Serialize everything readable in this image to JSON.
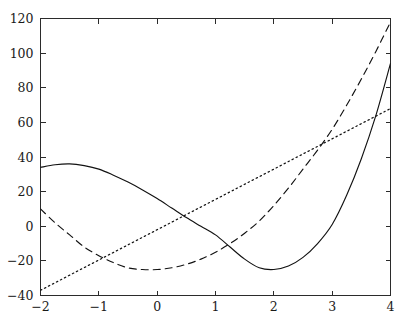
{
  "chart_data": {
    "type": "line",
    "title": "",
    "subtitle": "",
    "xlabel": "",
    "ylabel": "",
    "xlim": [
      -2,
      4
    ],
    "ylim": [
      -40,
      120
    ],
    "grid": false,
    "legend_position": "none",
    "x_ticks": [
      -2,
      -1,
      0,
      1,
      2,
      3,
      4
    ],
    "x_tick_labels": [
      "-2",
      "-1",
      "0",
      "1",
      "2",
      "3",
      "4"
    ],
    "y_ticks": [
      -40,
      -20,
      0,
      20,
      40,
      60,
      80,
      100,
      120
    ],
    "y_tick_labels": [
      "-40",
      "-20",
      "0",
      "20",
      "40",
      "60",
      "80",
      "100",
      "120"
    ],
    "series": [
      {
        "name": "solid-curve",
        "style": "solid",
        "color": "#121212",
        "x": [
          -2,
          -1.75,
          -1.5,
          -1.25,
          -1,
          -0.75,
          -0.5,
          -0.25,
          0,
          0.25,
          0.5,
          0.75,
          1,
          1.25,
          1.5,
          1.75,
          2,
          2.25,
          2.5,
          2.75,
          3,
          3.25,
          3.5,
          3.75,
          4
        ],
        "values": [
          34,
          35.5,
          36,
          35,
          33,
          29.5,
          25.5,
          21,
          16,
          10.5,
          5,
          0,
          -5,
          -12,
          -19,
          -24,
          -25,
          -23,
          -18,
          -10,
          1,
          18,
          39,
          64,
          94
        ]
      },
      {
        "name": "dashed-curve",
        "style": "dashed",
        "color": "#121212",
        "x": [
          -2,
          -1.75,
          -1.5,
          -1.25,
          -1,
          -0.75,
          -0.5,
          -0.25,
          0,
          0.25,
          0.5,
          0.75,
          1,
          1.25,
          1.5,
          1.75,
          2,
          2.25,
          2.5,
          2.75,
          3,
          3.25,
          3.5,
          3.75,
          4
        ],
        "values": [
          10,
          2,
          -5,
          -12,
          -17,
          -21,
          -24,
          -25,
          -25,
          -24,
          -22,
          -19,
          -15,
          -10,
          -4,
          3,
          12,
          22,
          33,
          44,
          56,
          70,
          85,
          101,
          118
        ]
      },
      {
        "name": "dotted-line",
        "style": "dotted",
        "color": "#121212",
        "x": [
          -2,
          4
        ],
        "values": [
          -37,
          68
        ]
      }
    ]
  },
  "caption": {
    "clipped_text": ""
  }
}
